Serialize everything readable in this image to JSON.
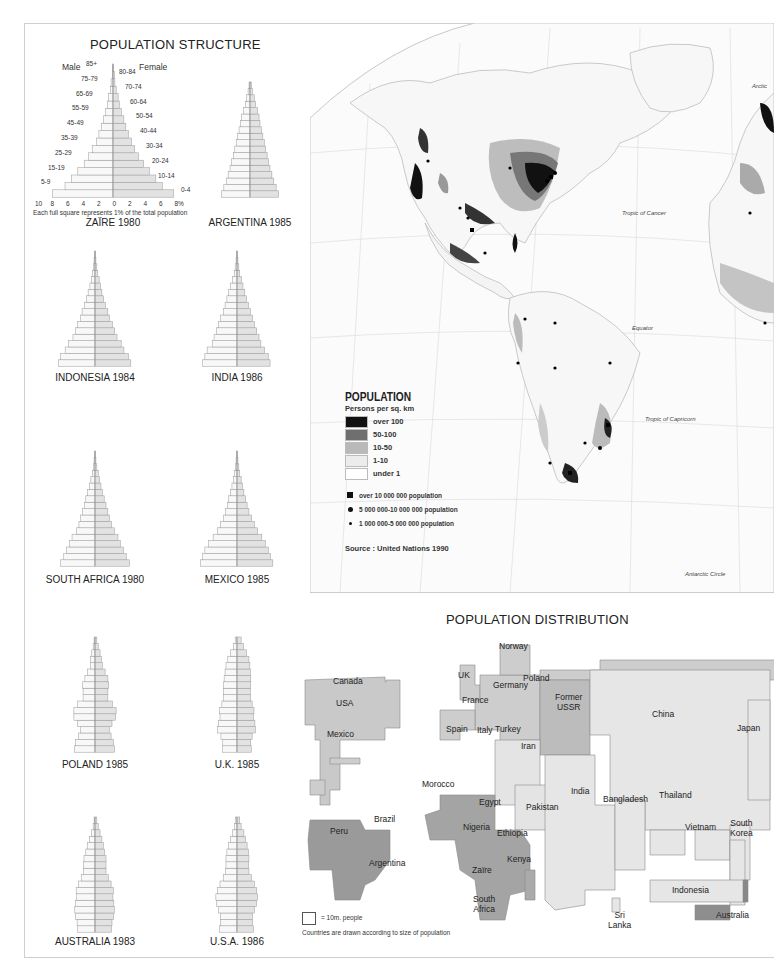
{
  "page": {
    "structure_title": "POPULATION STRUCTURE",
    "distribution_title": "POPULATION DISTRIBUTION"
  },
  "pyramid_key": {
    "male_label": "Male",
    "female_label": "Female",
    "left_ages": [
      "85+",
      "75-79",
      "65-69",
      "55-59",
      "45-49",
      "35-39",
      "25-29",
      "15-19",
      "5-9"
    ],
    "right_ages": [
      "80-84",
      "70-74",
      "60-64",
      "50-54",
      "40-44",
      "30-34",
      "20-24",
      "10-14",
      "0-4"
    ],
    "ticks": [
      "10",
      "8",
      "6",
      "4",
      "2",
      "0",
      "2",
      "4",
      "6",
      "8%"
    ],
    "note": "Each full square represents 1% of the total population"
  },
  "density_legend": {
    "title": "POPULATION",
    "subtitle": "Persons per sq. km",
    "classes": [
      {
        "label": "over 100",
        "color": "#111111"
      },
      {
        "label": "50-100",
        "color": "#6f6f6f"
      },
      {
        "label": "10-50",
        "color": "#b9b9b9"
      },
      {
        "label": "1-10",
        "color": "#ececec"
      },
      {
        "label": "under 1",
        "color": "#ffffff"
      }
    ],
    "cities": [
      {
        "symbol": "square",
        "label": "over 10 000 000 population"
      },
      {
        "symbol": "dot-large",
        "label": "5 000 000-10 000 000 population"
      },
      {
        "symbol": "dot-small",
        "label": "1 000 000-5 000 000 population"
      }
    ],
    "source": "Source : United Nations 1990"
  },
  "map_labels": {
    "arctic": "Arctic",
    "tropic_cancer": "Tropic of Cancer",
    "equator": "Equator",
    "tropic_capricorn": "Tropic of Capricorn",
    "antarctic": "Antarctic Circle"
  },
  "cartogram": {
    "countries": [
      "Canada",
      "USA",
      "Mexico",
      "Brazil",
      "Peru",
      "Argentina",
      "UK",
      "Norway",
      "Poland",
      "Germany",
      "France",
      "Spain",
      "Italy",
      "Former USSR",
      "Turkey",
      "Iran",
      "Morocco",
      "Egypt",
      "Nigeria",
      "Ethiopia",
      "Kenya",
      "Zaïre",
      "South Africa",
      "Pakistan",
      "India",
      "Bangladesh",
      "China",
      "Japan",
      "Thailand",
      "Vietnam",
      "South Korea",
      "Indonesia",
      "Sri Lanka",
      "Australia"
    ],
    "key_label": "= 10m. people",
    "note": "Countries are drawn according to size of population",
    "colors": {
      "americas": "#c9c9c9",
      "europe": "#cdcdcd",
      "africa_latam": "#9a9a9a",
      "asia": "#e6e6e6"
    }
  },
  "chart_data": [
    {
      "type": "bar",
      "title": "ZAÏRE 1980",
      "categories": [
        "0-4",
        "5-9",
        "10-14",
        "15-19",
        "20-24",
        "25-29",
        "30-34",
        "35-39",
        "40-44",
        "45-49",
        "50-54",
        "55-59",
        "60-64",
        "65-69",
        "70-74",
        "75-79",
        "80-84",
        "85+"
      ],
      "series": [
        {
          "name": "Male",
          "values": [
            9.5,
            7.5,
            6.5,
            5.5,
            4.5,
            3.8,
            3.2,
            2.6,
            2.2,
            1.8,
            1.5,
            1.2,
            0.9,
            0.7,
            0.4,
            0.3,
            0.1,
            0.1
          ]
        },
        {
          "name": "Female",
          "values": [
            9.5,
            7.7,
            6.7,
            5.7,
            4.8,
            4.0,
            3.4,
            2.9,
            2.4,
            2.0,
            1.7,
            1.3,
            1.0,
            0.8,
            0.5,
            0.3,
            0.2,
            0.1
          ]
        }
      ],
      "xlabel": "% of total population",
      "xlim": [
        -10,
        10
      ]
    },
    {
      "type": "bar",
      "title": "ARGENTINA 1985",
      "categories": [
        "0-4",
        "5-9",
        "10-14",
        "15-19",
        "20-24",
        "25-29",
        "30-34",
        "35-39",
        "40-44",
        "45-49",
        "50-54",
        "55-59",
        "60-64",
        "65-69",
        "70-74",
        "75-79",
        "80-84",
        "85+"
      ],
      "series": [
        {
          "name": "Male",
          "values": [
            6,
            5.5,
            5,
            4.6,
            4.2,
            3.9,
            3.5,
            3.2,
            2.9,
            2.6,
            2.3,
            2,
            1.8,
            1.4,
            1,
            0.7,
            0.4,
            0.2
          ]
        },
        {
          "name": "Female",
          "values": [
            6,
            5.5,
            5,
            4.6,
            4.2,
            3.9,
            3.6,
            3.3,
            3.0,
            2.7,
            2.4,
            2.1,
            1.9,
            1.6,
            1.2,
            0.9,
            0.5,
            0.3
          ]
        }
      ]
    },
    {
      "type": "bar",
      "title": "INDONESIA 1984",
      "categories": [
        "0-4",
        "5-9",
        "10-14",
        "15-19",
        "20-24",
        "25-29",
        "30-34",
        "35-39",
        "40-44",
        "45-49",
        "50-54",
        "55-59",
        "60-64",
        "65-69",
        "70-74",
        "75-79",
        "80-84",
        "85+"
      ],
      "series": [
        {
          "name": "Male",
          "values": [
            8,
            7.5,
            6.5,
            5.8,
            4.8,
            4.2,
            3.8,
            3.2,
            2.8,
            2.3,
            1.9,
            1.5,
            1.1,
            0.8,
            0.5,
            0.3,
            0.2,
            0.1
          ]
        },
        {
          "name": "Female",
          "values": [
            7.8,
            7.3,
            6.3,
            5.7,
            4.8,
            4.3,
            3.8,
            3.2,
            2.8,
            2.3,
            1.9,
            1.5,
            1.2,
            0.9,
            0.6,
            0.4,
            0.2,
            0.1
          ]
        }
      ]
    },
    {
      "type": "bar",
      "title": "INDIA 1986",
      "categories": [
        "0-4",
        "5-9",
        "10-14",
        "15-19",
        "20-24",
        "25-29",
        "30-34",
        "35-39",
        "40-44",
        "45-49",
        "50-54",
        "55-59",
        "60-64",
        "65-69",
        "70-74",
        "75-79",
        "80-84",
        "85+"
      ],
      "series": [
        {
          "name": "Male",
          "values": [
            7.5,
            7,
            6.5,
            5.4,
            5,
            4.5,
            4,
            3.6,
            3,
            2.6,
            2.2,
            1.8,
            1.4,
            1.0,
            0.6,
            0.4,
            0.2,
            0.1
          ]
        },
        {
          "name": "Female",
          "values": [
            7.2,
            6.8,
            6,
            5.2,
            4.8,
            4.3,
            3.8,
            3.4,
            2.9,
            2.5,
            2.1,
            1.7,
            1.3,
            1.0,
            0.6,
            0.4,
            0.2,
            0.1
          ]
        }
      ]
    },
    {
      "type": "bar",
      "title": "SOUTH AFRICA 1980",
      "categories": [
        "0-4",
        "5-9",
        "10-14",
        "15-19",
        "20-24",
        "25-29",
        "30-34",
        "35-39",
        "40-44",
        "45-49",
        "50-54",
        "55-59",
        "60-64",
        "65-69",
        "70-74",
        "75-79",
        "80-84",
        "85+"
      ],
      "series": [
        {
          "name": "Male",
          "values": [
            7.5,
            6.8,
            6.2,
            5.5,
            5,
            4,
            3.5,
            3.2,
            2.7,
            2.3,
            2,
            1.6,
            1.2,
            0.9,
            0.6,
            0.3,
            0.2,
            0.1
          ]
        },
        {
          "name": "Female",
          "values": [
            7.5,
            6.8,
            6.2,
            5.5,
            5,
            4.2,
            3.6,
            3.2,
            2.8,
            2.4,
            2,
            1.6,
            1.3,
            1.0,
            0.7,
            0.4,
            0.2,
            0.1
          ]
        }
      ]
    },
    {
      "type": "bar",
      "title": "MEXICO 1985",
      "categories": [
        "0-4",
        "5-9",
        "10-14",
        "15-19",
        "20-24",
        "25-29",
        "30-34",
        "35-39",
        "40-44",
        "45-49",
        "50-54",
        "55-59",
        "60-64",
        "65-69",
        "70-74",
        "75-79",
        "80-84",
        "85+"
      ],
      "series": [
        {
          "name": "Male",
          "values": [
            8,
            7.5,
            7,
            6.2,
            5.2,
            4.3,
            3.6,
            3,
            2.5,
            2.1,
            1.8,
            1.4,
            1.1,
            0.8,
            0.5,
            0.3,
            0.2,
            0.1
          ]
        },
        {
          "name": "Female",
          "values": [
            7.8,
            7.3,
            6.8,
            6.2,
            5.4,
            4.5,
            3.8,
            3.2,
            2.6,
            2.2,
            1.9,
            1.5,
            1.2,
            0.9,
            0.6,
            0.4,
            0.2,
            0.1
          ]
        }
      ]
    },
    {
      "type": "bar",
      "title": "POLAND 1985",
      "categories": [
        "0-4",
        "5-9",
        "10-14",
        "15-19",
        "20-24",
        "25-29",
        "30-34",
        "35-39",
        "40-44",
        "45-49",
        "50-54",
        "55-59",
        "60-64",
        "65-69",
        "70-74",
        "75-79",
        "80-84",
        "85+"
      ],
      "series": [
        {
          "name": "Male",
          "values": [
            4.5,
            4.2,
            3.6,
            3.2,
            3.8,
            4.6,
            4.6,
            3.8,
            2.6,
            2.6,
            2.7,
            2.2,
            1.6,
            1.0,
            1.0,
            0.7,
            0.4,
            0.2
          ]
        },
        {
          "name": "Female",
          "values": [
            4.3,
            4.0,
            3.5,
            3.1,
            3.7,
            4.5,
            4.6,
            3.8,
            2.8,
            2.8,
            3.0,
            2.8,
            2.2,
            1.6,
            1.4,
            1.1,
            0.7,
            0.4
          ]
        }
      ]
    },
    {
      "type": "bar",
      "title": "U.K. 1985",
      "categories": [
        "0-4",
        "5-9",
        "10-14",
        "15-19",
        "20-24",
        "25-29",
        "30-34",
        "35-39",
        "40-44",
        "45-49",
        "50-54",
        "55-59",
        "60-64",
        "65-69",
        "70-74",
        "75-79",
        "80-84",
        "85+"
      ],
      "series": [
        {
          "name": "Male",
          "values": [
            3.2,
            3.1,
            3.5,
            4.2,
            4.0,
            3.7,
            3.8,
            3.3,
            3.0,
            2.9,
            2.9,
            2.8,
            2.6,
            2.4,
            2.0,
            1.4,
            0.8,
            0.4
          ]
        },
        {
          "name": "Female",
          "values": [
            3.1,
            3.0,
            3.3,
            4.0,
            3.9,
            3.6,
            3.7,
            3.3,
            3.0,
            2.9,
            3.0,
            3.0,
            2.9,
            2.8,
            2.6,
            2.1,
            1.4,
            0.9
          ]
        }
      ]
    },
    {
      "type": "bar",
      "title": "AUSTRALIA 1983",
      "categories": [
        "0-4",
        "5-9",
        "10-14",
        "15-19",
        "20-24",
        "25-29",
        "30-34",
        "35-39",
        "40-44",
        "45-49",
        "50-54",
        "55-59",
        "60-64",
        "65-69",
        "70-74",
        "75-79",
        "80-84",
        "85+"
      ],
      "series": [
        {
          "name": "Male",
          "values": [
            3.8,
            3.9,
            4.3,
            4.4,
            4.2,
            4.0,
            4.1,
            3.6,
            3.0,
            2.5,
            2.5,
            2.4,
            2.0,
            1.6,
            1.2,
            0.8,
            0.4,
            0.2
          ]
        },
        {
          "name": "Female",
          "values": [
            3.6,
            3.7,
            4.1,
            4.2,
            4.1,
            3.9,
            4.0,
            3.5,
            2.9,
            2.4,
            2.4,
            2.4,
            2.1,
            1.8,
            1.5,
            1.1,
            0.7,
            0.4
          ]
        }
      ]
    },
    {
      "type": "bar",
      "title": "U.S.A. 1986",
      "categories": [
        "0-4",
        "5-9",
        "10-14",
        "15-19",
        "20-24",
        "25-29",
        "30-34",
        "35-39",
        "40-44",
        "45-49",
        "50-54",
        "55-59",
        "60-64",
        "65-69",
        "70-74",
        "75-79",
        "80-84",
        "85+"
      ],
      "series": [
        {
          "name": "Male",
          "values": [
            3.8,
            3.6,
            3.6,
            4.0,
            4.5,
            4.6,
            4.3,
            3.7,
            3.0,
            2.5,
            2.4,
            2.4,
            2.2,
            1.8,
            1.4,
            1.0,
            0.5,
            0.3
          ]
        },
        {
          "name": "Female",
          "values": [
            3.6,
            3.4,
            3.4,
            3.8,
            4.3,
            4.5,
            4.3,
            3.8,
            3.1,
            2.6,
            2.5,
            2.6,
            2.5,
            2.2,
            1.9,
            1.5,
            0.9,
            0.6
          ]
        }
      ]
    }
  ]
}
